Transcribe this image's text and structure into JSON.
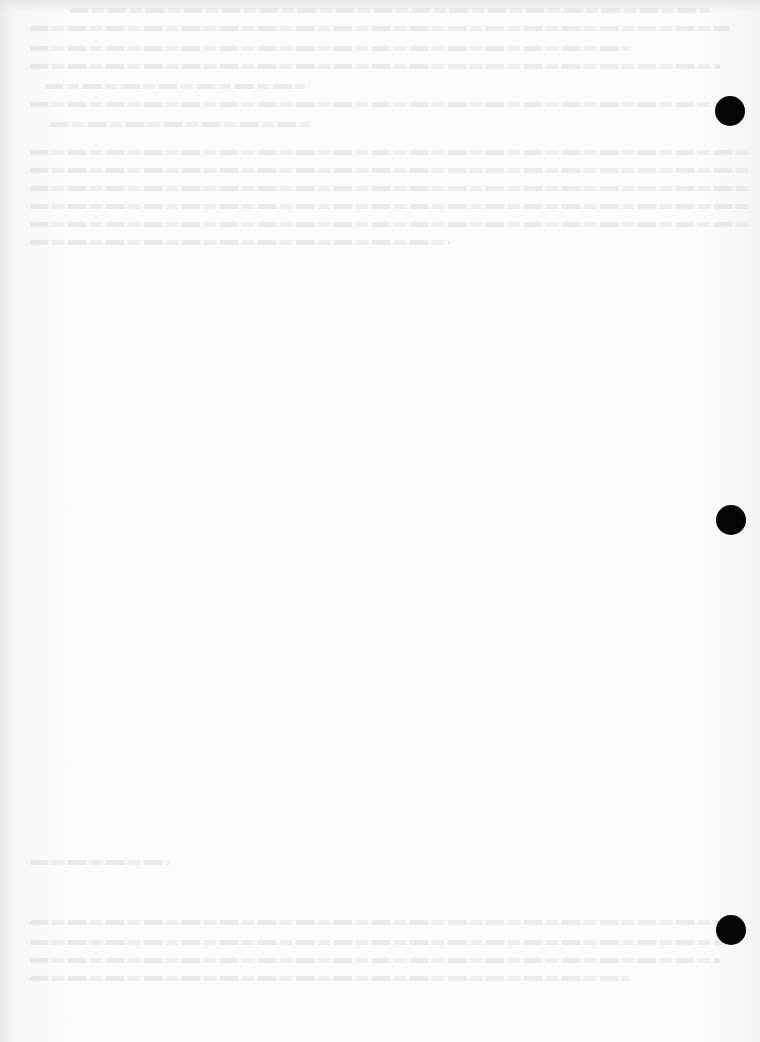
{
  "document": {
    "type": "scanned page",
    "text_legibility": "illegible show-through (reverse-side bleed)",
    "background_color": "#fbfbfb"
  },
  "text_regions": [
    {
      "id": "top-block",
      "top": 8,
      "lines": [
        {
          "x": 70,
          "y": 8,
          "w": 640
        },
        {
          "x": 30,
          "y": 26,
          "w": 700
        },
        {
          "x": 30,
          "y": 46,
          "w": 600
        },
        {
          "x": 30,
          "y": 64,
          "w": 690
        },
        {
          "x": 45,
          "y": 84,
          "w": 260
        },
        {
          "x": 30,
          "y": 102,
          "w": 690
        },
        {
          "x": 50,
          "y": 122,
          "w": 260
        },
        {
          "x": 30,
          "y": 150,
          "w": 720
        },
        {
          "x": 30,
          "y": 168,
          "w": 720
        },
        {
          "x": 30,
          "y": 186,
          "w": 720
        },
        {
          "x": 30,
          "y": 204,
          "w": 720
        },
        {
          "x": 30,
          "y": 222,
          "w": 720
        },
        {
          "x": 30,
          "y": 240,
          "w": 420
        }
      ]
    },
    {
      "id": "bottom-block",
      "top": 860,
      "lines": [
        {
          "x": 30,
          "y": 860,
          "w": 140
        },
        {
          "x": 30,
          "y": 920,
          "w": 700
        },
        {
          "x": 30,
          "y": 940,
          "w": 700
        },
        {
          "x": 30,
          "y": 958,
          "w": 690
        },
        {
          "x": 30,
          "y": 976,
          "w": 600
        }
      ]
    }
  ],
  "punch_holes": [
    {
      "cx": 730,
      "cy": 111,
      "r": 15,
      "color": "#050505"
    },
    {
      "cx": 731,
      "cy": 520,
      "r": 15,
      "color": "#050505"
    },
    {
      "cx": 731,
      "cy": 930,
      "r": 15,
      "color": "#050505"
    }
  ]
}
